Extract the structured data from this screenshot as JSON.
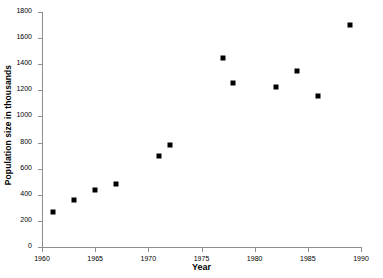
{
  "chart_data": {
    "type": "scatter",
    "title": "",
    "xlabel": "Year",
    "ylabel": "Population size in thousands",
    "xlim": [
      1960,
      1990
    ],
    "ylim": [
      0,
      1800
    ],
    "xticks": [
      1960,
      1965,
      1970,
      1975,
      1980,
      1985,
      1990
    ],
    "yticks": [
      0,
      200,
      400,
      600,
      800,
      1000,
      1200,
      1400,
      1600,
      1800
    ],
    "grid": false,
    "legend": null,
    "marker": "square",
    "marker_color": "#000000",
    "axis_color": "#8e8e8e",
    "x": [
      1961,
      1963,
      1965,
      1967,
      1971,
      1972,
      1977,
      1978,
      1982,
      1984,
      1986,
      1989
    ],
    "y": [
      265,
      360,
      440,
      485,
      700,
      780,
      1450,
      1260,
      1225,
      1350,
      1160,
      1700
    ],
    "points": [
      {
        "x": 1961,
        "y": 265
      },
      {
        "x": 1963,
        "y": 360
      },
      {
        "x": 1965,
        "y": 440
      },
      {
        "x": 1967,
        "y": 485
      },
      {
        "x": 1971,
        "y": 700
      },
      {
        "x": 1972,
        "y": 780
      },
      {
        "x": 1977,
        "y": 1450
      },
      {
        "x": 1978,
        "y": 1260
      },
      {
        "x": 1982,
        "y": 1225
      },
      {
        "x": 1984,
        "y": 1350
      },
      {
        "x": 1986,
        "y": 1160
      },
      {
        "x": 1989,
        "y": 1700
      }
    ]
  }
}
